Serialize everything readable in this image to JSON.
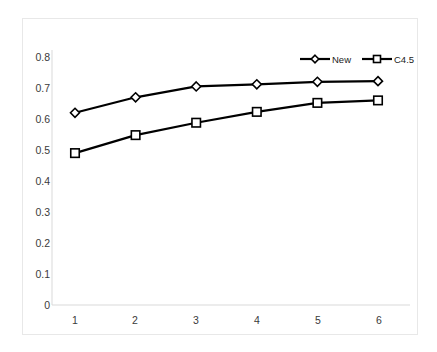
{
  "chart_data": {
    "type": "line",
    "title": "",
    "subtitle": "",
    "xlabel": "",
    "ylabel": "",
    "x": [
      1,
      2,
      3,
      4,
      5,
      6
    ],
    "categories": [
      "1",
      "2",
      "3",
      "4",
      "5",
      "6"
    ],
    "series": [
      {
        "name": "New",
        "marker": "diamond",
        "color": "#000000",
        "values": [
          0.62,
          0.67,
          0.705,
          0.712,
          0.72,
          0.722
        ]
      },
      {
        "name": "C4.5",
        "marker": "square",
        "color": "#000000",
        "values": [
          0.49,
          0.548,
          0.588,
          0.623,
          0.652,
          0.66
        ]
      }
    ],
    "xlim": [
      0.5,
      6.5
    ],
    "ylim": [
      0,
      0.8
    ],
    "yticks": [
      0,
      0.1,
      0.2,
      0.3,
      0.4,
      0.5,
      0.6,
      0.7,
      0.8
    ],
    "ytick_labels": [
      "0",
      "0.1",
      "0.2",
      "0.3",
      "0.4",
      "0.5",
      "0.6",
      "0.7",
      "0.8"
    ],
    "xticks": [
      1,
      2,
      3,
      4,
      5,
      6
    ],
    "xtick_labels": [
      "1",
      "2",
      "3",
      "4",
      "5",
      "6"
    ],
    "grid": false,
    "legend_position": "top-right",
    "legend_entries": [
      "New",
      "C4.5"
    ],
    "plot_border_color": "#e8e8e8",
    "axis_color": "#d9d9d9",
    "background": "#ffffff"
  },
  "axes": {
    "y_labels": [
      "0.8",
      "0.7",
      "0.6",
      "0.5",
      "0.4",
      "0.3",
      "0.2",
      "0.1",
      "0"
    ],
    "x_labels": [
      "1",
      "2",
      "3",
      "4",
      "5",
      "6"
    ]
  },
  "legend": {
    "items": [
      {
        "label": "New",
        "marker": "diamond-marker"
      },
      {
        "label": "C4.5",
        "marker": "square-marker"
      }
    ]
  }
}
